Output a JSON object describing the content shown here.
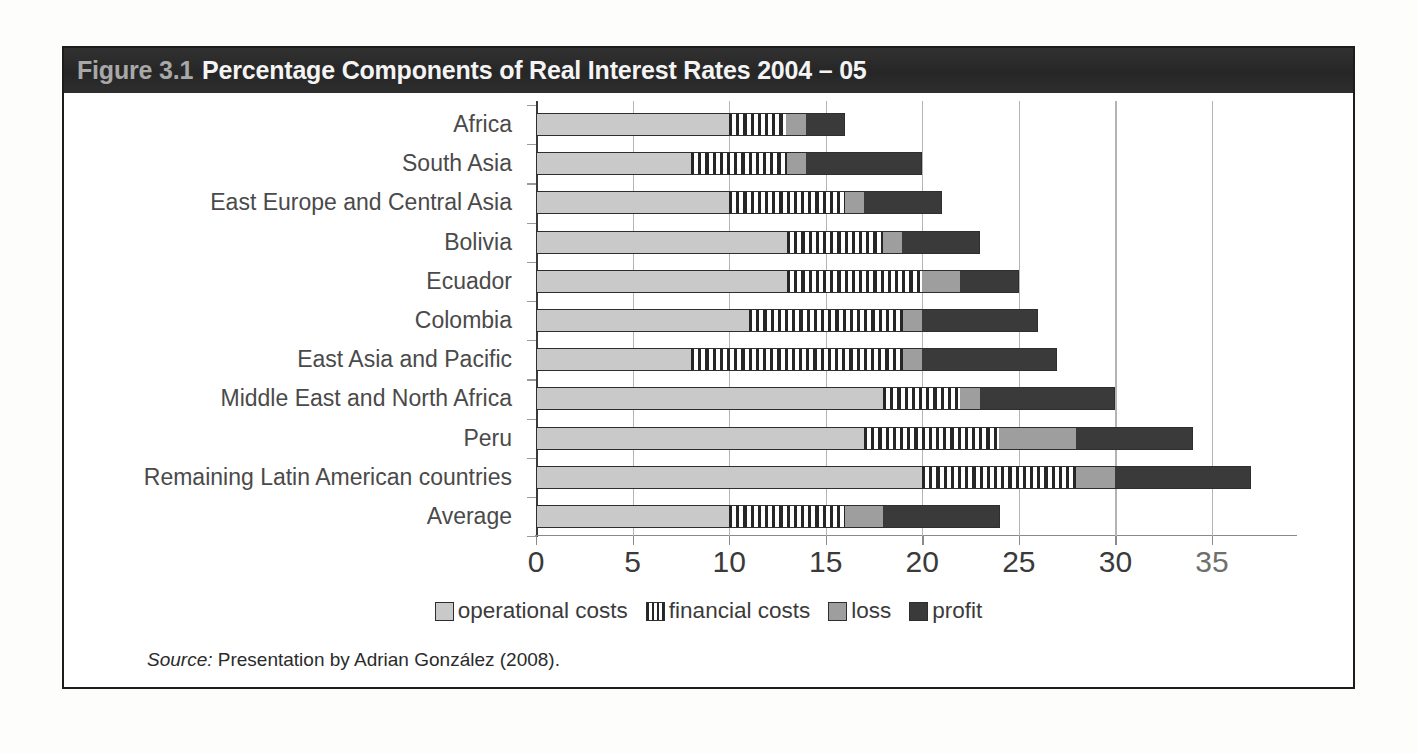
{
  "figure": {
    "number_label": "Figure 3.1",
    "title": "Percentage Components of Real Interest Rates 2004 – 05",
    "source_prefix": "Source:",
    "source_text": " Presentation by Adrian González (2008)."
  },
  "colors": {
    "title_bar_background": "#2b2b2b",
    "title_number": "#a8a8a8",
    "title_text": "#f4f4f4",
    "operational_costs": "#c9c9c9",
    "financial_costs": "#ffffff",
    "loss": "#9e9e9e",
    "profit": "#3a3a3a",
    "gridline": "#b4b4b4",
    "axis": "#8a8a8a",
    "frame": "#1d1d1b"
  },
  "legend": {
    "position": "bottom",
    "items": [
      {
        "label": "operational costs",
        "swatch": "sw-operational"
      },
      {
        "label": "financial costs",
        "swatch": "sw-financial"
      },
      {
        "label": "loss",
        "swatch": "sw-loss"
      },
      {
        "label": "profit",
        "swatch": "sw-profit"
      }
    ]
  },
  "chart_data": {
    "type": "bar",
    "orientation": "horizontal",
    "stacked": true,
    "title": "Percentage Components of Real Interest Rates 2004 – 05",
    "xlabel": "",
    "ylabel": "",
    "xlim": [
      0,
      39.4
    ],
    "ylim": null,
    "grid": true,
    "xticks": [
      0,
      5,
      10,
      15,
      20,
      25,
      30,
      35
    ],
    "xticklabels": [
      "0",
      "5",
      "10",
      "15",
      "20",
      "25",
      "30",
      "35"
    ],
    "categories": [
      "Africa",
      "South Asia",
      "East Europe and Central Asia",
      "Bolivia",
      "Ecuador",
      "Colombia",
      "East Asia and Pacific",
      "Middle East and North Africa",
      "Peru",
      "Remaining Latin American countries",
      "Average"
    ],
    "series": [
      {
        "name": "operational costs",
        "values": [
          10,
          8,
          10,
          13,
          13,
          11,
          8,
          18,
          17,
          20,
          10
        ]
      },
      {
        "name": "financial costs",
        "values": [
          3,
          5,
          6,
          5,
          7,
          8,
          11,
          4,
          7,
          8,
          6
        ]
      },
      {
        "name": "loss",
        "values": [
          1,
          1,
          1,
          1,
          2,
          1,
          1,
          1,
          4,
          2,
          2
        ]
      },
      {
        "name": "profit",
        "values": [
          2,
          6,
          4,
          4,
          3,
          6,
          7,
          7,
          6,
          7,
          6
        ]
      }
    ],
    "totals": [
      16,
      20,
      21,
      23,
      25,
      26,
      27,
      30,
      34,
      37,
      24
    ]
  }
}
